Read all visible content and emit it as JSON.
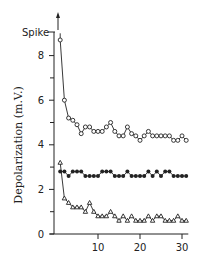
{
  "chart_data": {
    "type": "line",
    "title": "",
    "xlabel": "",
    "ylabel": "Depolarization (m.V.)",
    "xlim": [
      0,
      31
    ],
    "ylim": [
      0,
      9
    ],
    "x_ticks": [
      10,
      20,
      30
    ],
    "y_ticks": [
      0,
      2,
      4,
      6,
      8
    ],
    "y_tick_minor": [
      1,
      3,
      5,
      7
    ],
    "spike_label": "Spike",
    "spike_level": 9,
    "grid": false,
    "legend": null,
    "series": [
      {
        "name": "open-circles",
        "marker": "open-circle",
        "x": [
          1,
          2,
          3,
          4,
          5,
          6,
          7,
          8,
          9,
          10,
          11,
          12,
          13,
          14,
          15,
          16,
          17,
          18,
          19,
          20,
          21,
          22,
          23,
          24,
          25,
          26,
          27,
          28,
          29,
          30,
          31
        ],
        "values": [
          8.7,
          6.0,
          5.2,
          5.1,
          4.9,
          4.5,
          4.8,
          4.8,
          4.6,
          4.6,
          4.6,
          4.8,
          5.0,
          4.6,
          4.4,
          4.4,
          4.8,
          4.5,
          4.4,
          4.2,
          4.4,
          4.6,
          4.4,
          4.4,
          4.4,
          4.4,
          4.4,
          4.2,
          4.2,
          4.4,
          4.2
        ]
      },
      {
        "name": "filled-circles",
        "marker": "filled-circle",
        "x": [
          1,
          2,
          3,
          4,
          5,
          6,
          7,
          8,
          9,
          10,
          11,
          12,
          13,
          14,
          15,
          16,
          17,
          18,
          19,
          20,
          21,
          22,
          23,
          24,
          25,
          26,
          27,
          28,
          29,
          30,
          31
        ],
        "values": [
          2.8,
          2.8,
          2.6,
          2.8,
          2.8,
          2.8,
          2.6,
          2.6,
          2.6,
          2.6,
          2.8,
          2.8,
          2.8,
          2.6,
          2.6,
          2.6,
          2.8,
          2.6,
          2.6,
          2.6,
          2.6,
          2.8,
          2.6,
          2.8,
          2.6,
          2.8,
          2.8,
          2.6,
          2.6,
          2.6,
          2.6
        ]
      },
      {
        "name": "open-triangles",
        "marker": "open-triangle",
        "x": [
          1,
          2,
          3,
          4,
          5,
          6,
          7,
          8,
          9,
          10,
          11,
          12,
          13,
          14,
          15,
          16,
          17,
          18,
          19,
          20,
          21,
          22,
          23,
          24,
          25,
          26,
          27,
          28,
          29,
          30,
          31
        ],
        "values": [
          3.2,
          1.6,
          1.4,
          1.2,
          1.2,
          1.2,
          1.0,
          1.4,
          1.0,
          0.8,
          0.8,
          0.8,
          1.0,
          0.8,
          0.6,
          0.8,
          0.6,
          0.8,
          0.6,
          0.6,
          0.6,
          0.8,
          0.6,
          0.8,
          0.8,
          0.6,
          0.6,
          0.6,
          0.8,
          0.6,
          0.6
        ]
      }
    ]
  }
}
